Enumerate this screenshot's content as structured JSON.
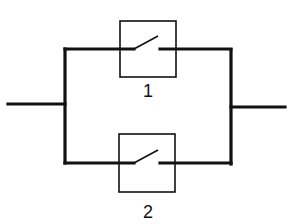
{
  "diagram": {
    "type": "parallel-switch-circuit",
    "switches": [
      {
        "label": "1",
        "state": "open"
      },
      {
        "label": "2",
        "state": "open"
      }
    ],
    "colors": {
      "line": "#111111",
      "background": "#ffffff"
    }
  }
}
